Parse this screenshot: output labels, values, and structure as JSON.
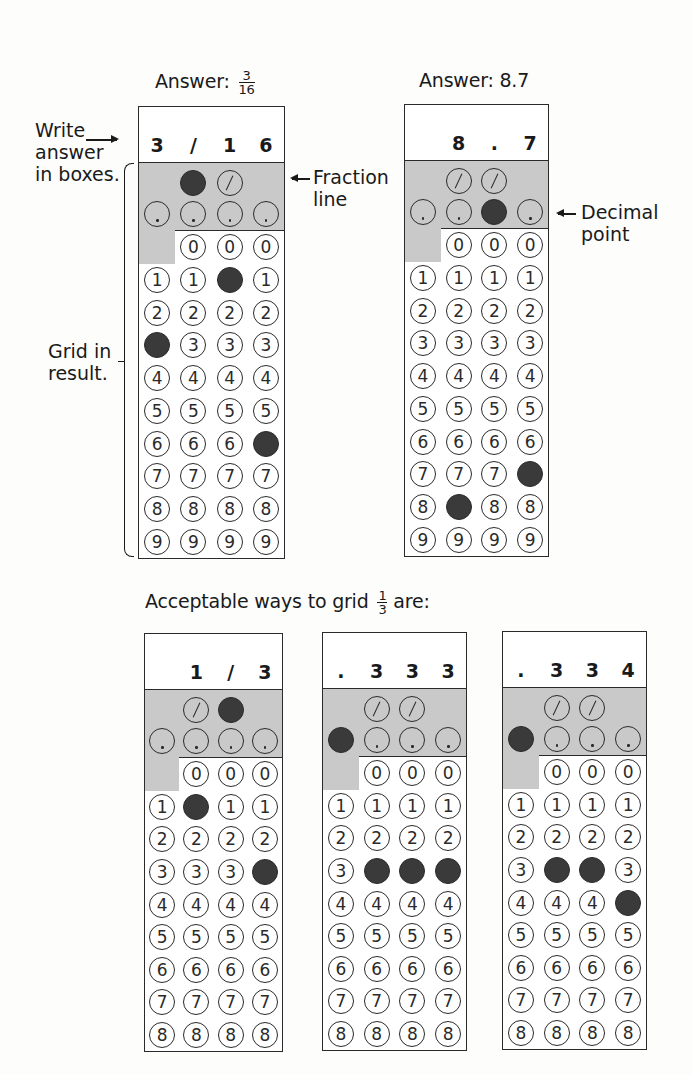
{
  "examples": [
    {
      "id": "fraction",
      "caption_prefix": "Answer: ",
      "caption_fraction": {
        "num": "3",
        "den": "16"
      },
      "caption_text": "",
      "boxes": [
        "3",
        "/",
        "1",
        "6"
      ],
      "fills": [
        {
          "col": 0,
          "value": "3"
        },
        {
          "col": 1,
          "value": "/"
        },
        {
          "col": 2,
          "value": "1"
        },
        {
          "col": 3,
          "value": "6"
        }
      ],
      "rows": [
        "0",
        "1",
        "2",
        "3",
        "4",
        "5",
        "6",
        "7",
        "8",
        "9"
      ]
    },
    {
      "id": "decimal",
      "caption_prefix": "Answer: 8.7",
      "caption_fraction": null,
      "boxes": [
        "",
        "8",
        ".",
        "7"
      ],
      "fills": [
        {
          "col": 1,
          "value": "8"
        },
        {
          "col": 2,
          "value": "."
        },
        {
          "col": 3,
          "value": "7"
        }
      ],
      "rows": [
        "0",
        "1",
        "2",
        "3",
        "4",
        "5",
        "6",
        "7",
        "8",
        "9"
      ]
    }
  ],
  "labels": {
    "write_answer": [
      "Write",
      "answer",
      "in boxes."
    ],
    "grid_in": [
      "Grid in",
      "result."
    ],
    "fraction_line": [
      "Fraction",
      "line"
    ],
    "decimal_point": [
      "Decimal",
      "point"
    ]
  },
  "acceptable": {
    "caption_prefix": "Acceptable ways to grid ",
    "caption_fraction": {
      "num": "1",
      "den": "3"
    },
    "caption_suffix": " are:",
    "grids": [
      {
        "boxes": [
          "",
          "1",
          "/",
          "3"
        ],
        "fills": [
          {
            "col": 1,
            "value": "1"
          },
          {
            "col": 2,
            "value": "/"
          },
          {
            "col": 3,
            "value": "3"
          }
        ]
      },
      {
        "boxes": [
          ".",
          "3",
          "3",
          "3"
        ],
        "fills": [
          {
            "col": 0,
            "value": "."
          },
          {
            "col": 1,
            "value": "3"
          },
          {
            "col": 2,
            "value": "3"
          },
          {
            "col": 3,
            "value": "3"
          }
        ]
      },
      {
        "boxes": [
          ".",
          "3",
          "3",
          "4"
        ],
        "fills": [
          {
            "col": 0,
            "value": "."
          },
          {
            "col": 1,
            "value": "3"
          },
          {
            "col": 2,
            "value": "3"
          },
          {
            "col": 3,
            "value": "4"
          }
        ]
      }
    ],
    "rows": [
      "0",
      "1",
      "2",
      "3",
      "4",
      "5",
      "6",
      "7",
      "8"
    ]
  },
  "colors": {
    "shaded": "#c9c9c9",
    "filled_bubble": "#3a3a3a",
    "line": "#2a2a2a"
  }
}
